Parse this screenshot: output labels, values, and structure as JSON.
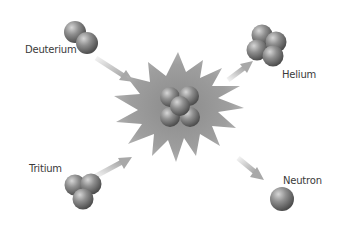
{
  "labels": {
    "deuterium": "Deuterium",
    "tritium": "Tritium",
    "helium": "Helium",
    "neutron": "Neutron"
  },
  "colors": {
    "background": "#ffffff",
    "sphere_light": "#c8c8c8",
    "sphere_dark": "#5a5a5a",
    "burst": "#9a9a9a",
    "arrow": "#b8b8b8",
    "text": "#3a3a3a"
  },
  "particles": [
    {
      "name": "deuterium",
      "sphere_count": 2
    },
    {
      "name": "tritium",
      "sphere_count": 3
    },
    {
      "name": "fusion-core",
      "sphere_count": 5
    },
    {
      "name": "helium",
      "sphere_count": 4
    },
    {
      "name": "neutron",
      "sphere_count": 1
    }
  ],
  "arrows": [
    {
      "from": "deuterium",
      "to": "fusion-core"
    },
    {
      "from": "tritium",
      "to": "fusion-core"
    },
    {
      "from": "fusion-core",
      "to": "helium"
    },
    {
      "from": "fusion-core",
      "to": "neutron"
    }
  ]
}
